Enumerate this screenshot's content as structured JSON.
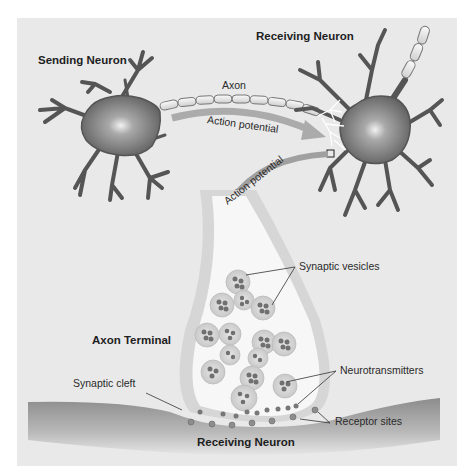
{
  "figure": {
    "colors": {
      "panel_bg": "#e9e9e9",
      "page_bg": "#ffffff",
      "neuron_body": "#7a7a7a",
      "neuron_dark": "#4a4a4a",
      "myelin": "#ececec",
      "arrow": "#a8a8a8",
      "terminal_fill": "#f7f7f7",
      "terminal_wall": "#cfcfcf",
      "vesicle": "#d6d6d6",
      "neurotransmitter": "#6e6e6e",
      "receiving_membrane": "#9a9a9a",
      "text": "#1e1e1e"
    },
    "labels": {
      "sending_neuron": "Sending Neuron",
      "receiving_neuron_top": "Receiving Neuron",
      "axon": "Axon",
      "action_potential_1": "Action potential",
      "action_potential_2": "Action potential",
      "synaptic_vesicles": "Synaptic vesicles",
      "axon_terminal": "Axon Terminal",
      "neurotransmitters": "Neurotransmitters",
      "synaptic_cleft": "Synaptic cleft",
      "receptor_sites": "Receptor sites",
      "receiving_neuron_bottom": "Receiving Neuron"
    },
    "components": [
      {
        "name": "sending-neuron",
        "label": "Sending Neuron"
      },
      {
        "name": "axon",
        "label": "Axon"
      },
      {
        "name": "receiving-neuron",
        "label": "Receiving Neuron"
      },
      {
        "name": "axon-terminal",
        "label": "Axon Terminal"
      },
      {
        "name": "synaptic-vesicles",
        "label": "Synaptic vesicles"
      },
      {
        "name": "neurotransmitters",
        "label": "Neurotransmitters"
      },
      {
        "name": "synaptic-cleft",
        "label": "Synaptic cleft"
      },
      {
        "name": "receptor-sites",
        "label": "Receptor sites"
      }
    ]
  }
}
